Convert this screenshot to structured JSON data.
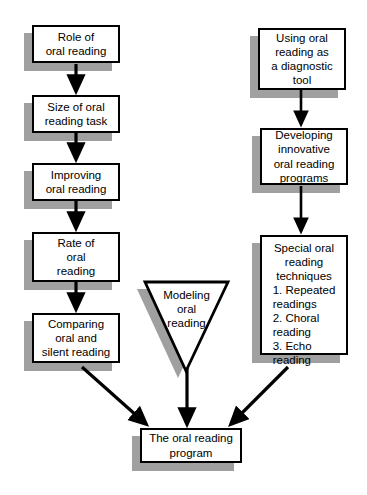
{
  "diagram": {
    "type": "flowchart",
    "colors": {
      "node_fill": "#ffffff",
      "node_border": "#000000",
      "shadow": "#a0a0a0",
      "arrow": "#000000",
      "background": "#ffffff"
    },
    "left_column": [
      {
        "id": "role",
        "label": "Role of\noral reading"
      },
      {
        "id": "size",
        "label": "Size of oral\nreading task"
      },
      {
        "id": "improving",
        "label": "Improving\noral reading"
      },
      {
        "id": "rate",
        "label": "Rate of\noral\nreading"
      },
      {
        "id": "comparing",
        "label": "Comparing\noral and\nsilent reading"
      }
    ],
    "right_column": [
      {
        "id": "diagnostic",
        "label": "Using oral\nreading as\na diagnostic\ntool"
      },
      {
        "id": "developing",
        "label": "Developing\ninnovative\noral reading\nprograms"
      },
      {
        "id": "special",
        "heading": "Special oral\nreading\ntechniques",
        "items": "1. Repeated\n    readings\n2. Choral\n    reading\n3. Echo\n    reading"
      }
    ],
    "center_triangle": {
      "id": "modeling",
      "label": "Modeling\noral\nreading"
    },
    "bottom_node": {
      "id": "program",
      "label": "The oral reading\nprogram"
    }
  }
}
